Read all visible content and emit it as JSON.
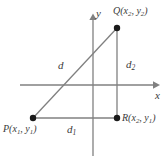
{
  "figure": {
    "background_color": "#ffffff",
    "line_color": "#808080",
    "point_color": "#1a1a1a",
    "text_color": "#3a3a3a",
    "axes": {
      "x_label": "x",
      "y_label": "y",
      "x_axis": {
        "x1": 20,
        "y1": 85,
        "x2": 160,
        "y2": 85,
        "arrow": "right"
      },
      "y_axis": {
        "x1": 93,
        "y1": 14,
        "x2": 93,
        "y2": 156,
        "arrow": "up"
      }
    },
    "points": [
      {
        "id": "Q",
        "name": "point-q",
        "label": "Q(x",
        "label_full": "Q(x₂, y₂)",
        "sub_1": "2",
        "mid": ", y",
        "sub_2": "2",
        "close": ")",
        "cx": 117,
        "cy": 28,
        "r": 3.2
      },
      {
        "id": "P",
        "name": "point-p",
        "label": "P(x",
        "label_full": "P(x₁, y₁)",
        "sub_1": "1",
        "mid": ", y",
        "sub_2": "1",
        "close": ")",
        "cx": 33,
        "cy": 118,
        "r": 3.2
      },
      {
        "id": "R",
        "name": "point-r",
        "label": "R(x",
        "label_full": "R(x₂, y₁)",
        "sub_1": "2",
        "mid": ", y",
        "sub_2": "1",
        "close": ")",
        "cx": 117,
        "cy": 118,
        "r": 3.2
      }
    ],
    "segments": [
      {
        "id": "d",
        "name": "segment-hypotenuse",
        "label": "d",
        "subscript": "",
        "from": "P",
        "to": "Q",
        "x1": 33,
        "y1": 118,
        "x2": 117,
        "y2": 28
      },
      {
        "id": "d1",
        "name": "segment-horizontal-leg",
        "label": "d",
        "subscript": "1",
        "from": "P",
        "to": "R",
        "x1": 33,
        "y1": 118,
        "x2": 117,
        "y2": 118
      },
      {
        "id": "d2",
        "name": "segment-vertical-leg",
        "label": "d",
        "subscript": "2",
        "from": "R",
        "to": "Q",
        "x1": 117,
        "y1": 118,
        "x2": 117,
        "y2": 28
      }
    ]
  }
}
